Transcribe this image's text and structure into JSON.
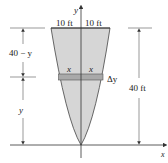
{
  "diagram": {
    "axes": {
      "x_label": "x",
      "y_label": "y"
    },
    "top_labels": {
      "left_half_width": "10 ft",
      "right_half_width": "10 ft"
    },
    "strip": {
      "left_label": "x",
      "right_label": "x",
      "thickness_label": "Δy"
    },
    "left_dimensions": {
      "upper": "40 − y",
      "lower": "y"
    },
    "right_dimension": {
      "height": "40 ft"
    },
    "colors": {
      "fill": "#d6d6d6",
      "strip": "#a9a9a9",
      "line": "#333333",
      "dim_line": "#555555"
    }
  }
}
